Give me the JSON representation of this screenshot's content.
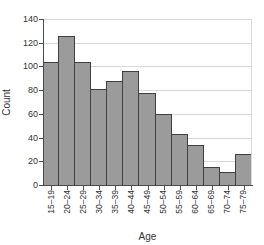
{
  "chart_data": {
    "type": "bar",
    "subtype": "histogram",
    "title": "",
    "xlabel": "Age",
    "ylabel": "Count",
    "categories": [
      "15–19",
      "20–24",
      "25–29",
      "30–34",
      "35–39",
      "40–44",
      "45–49",
      "50–54",
      "55–59",
      "60–64",
      "65–69",
      "70–74",
      "75–79"
    ],
    "values": [
      104,
      126,
      104,
      81,
      88,
      96,
      78,
      60,
      43,
      34,
      15,
      11,
      26
    ],
    "ylim": [
      0,
      140
    ],
    "ytick_step": 20,
    "yticks": [
      0,
      20,
      40,
      60,
      80,
      100,
      120,
      140
    ],
    "grid": true,
    "legend": "none",
    "colors": {
      "bar_fill": "#9b9b9b",
      "bar_border": "#3f3f3f",
      "grid": "#d9d9d9",
      "axis": "#4a4a4a",
      "text": "#333333",
      "background": "#ffffff"
    }
  }
}
